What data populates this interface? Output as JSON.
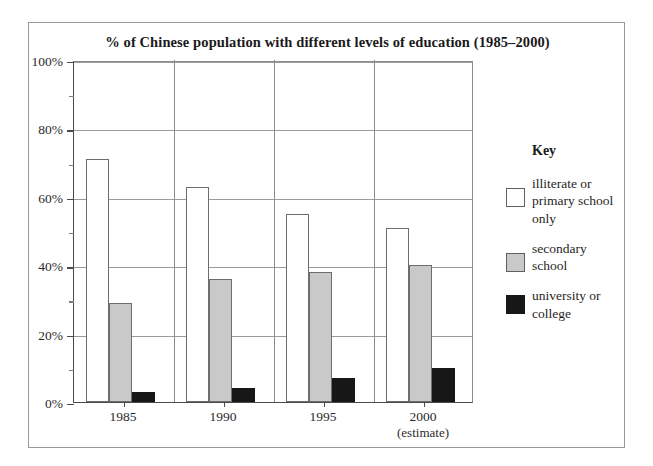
{
  "chart_data": {
    "type": "bar",
    "title": "% of Chinese population with different levels of education (1985–2000)",
    "xlabel": "",
    "ylabel": "",
    "categories": [
      "1985",
      "1990",
      "1995",
      "2000"
    ],
    "category_sublabels": [
      "",
      "",
      "",
      "(estimate)"
    ],
    "series": [
      {
        "name": "illiterate or primary school only",
        "values": [
          71,
          63,
          55,
          51
        ],
        "color": "#ffffff"
      },
      {
        "name": "secondary school",
        "values": [
          29,
          36,
          38,
          40
        ],
        "color": "#c9c9c9"
      },
      {
        "name": "university or college",
        "values": [
          3,
          4,
          7,
          10
        ],
        "color": "#171717"
      }
    ],
    "ylim": [
      0,
      100
    ],
    "ytick_labels": [
      "0%",
      "20%",
      "40%",
      "60%",
      "80%",
      "100%"
    ],
    "ytick_values": [
      0,
      20,
      40,
      60,
      80,
      100
    ],
    "yminor_values": [
      10,
      30,
      50,
      70,
      90
    ],
    "grid": "horizontal",
    "legend_position": "right",
    "legend_title": "Key"
  },
  "legend": {
    "title": "Key",
    "items": [
      {
        "label": "illiterate or primary school only",
        "swatch": "white"
      },
      {
        "label": "secondary school",
        "swatch": "gray"
      },
      {
        "label": "university or college",
        "swatch": "black"
      }
    ]
  }
}
